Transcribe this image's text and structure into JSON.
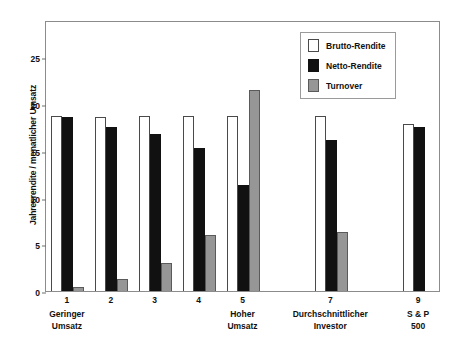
{
  "chart_data": {
    "type": "bar",
    "title": "",
    "xlabel": "",
    "ylabel": "Jahresrendite / monatlicher Umsatz",
    "ylim": [
      0,
      29
    ],
    "yticks": [
      0,
      5,
      10,
      15,
      20,
      25
    ],
    "grid": false,
    "legend_position": "top-right",
    "categories": [
      "1",
      "2",
      "3",
      "4",
      "5",
      "6",
      "7",
      "8",
      "9"
    ],
    "category_sublabels": [
      "Geringer\nUmsatz",
      "",
      "",
      "",
      "Hoher\nUmsatz",
      "",
      "Durchschnittlicher\nInvestor",
      "",
      "S & P\n500"
    ],
    "series": [
      {
        "name": "Brutto-Rendite",
        "color": "#ffffff",
        "values": [
          18.7,
          18.6,
          18.7,
          18.7,
          18.7,
          null,
          18.7,
          null,
          17.9
        ]
      },
      {
        "name": "Netto-Rendite",
        "color": "#111111",
        "values": [
          18.6,
          17.6,
          16.8,
          15.3,
          11.3,
          null,
          16.2,
          null,
          17.6
        ]
      },
      {
        "name": "Turnover",
        "color": "#969696",
        "values": [
          0.4,
          1.3,
          3.0,
          6.0,
          21.5,
          null,
          6.3,
          null,
          null
        ]
      }
    ]
  },
  "legend": {
    "items": [
      {
        "label": "Brutto-Rendite",
        "swatch": "brutto"
      },
      {
        "label": "Netto-Rendite",
        "swatch": "netto"
      },
      {
        "label": "Turnover",
        "swatch": "turnover"
      }
    ]
  }
}
